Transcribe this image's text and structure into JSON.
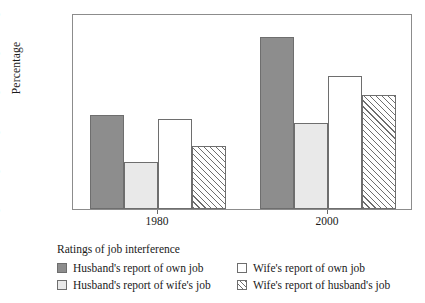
{
  "chart_data": {
    "type": "bar",
    "title": "",
    "xlabel": "",
    "ylabel": "Percentage",
    "categories": [
      "1980",
      "2000"
    ],
    "ylim": [
      0,
      50
    ],
    "yticks": [
      0,
      10,
      20,
      30,
      40,
      50
    ],
    "grid": false,
    "legend_position": "bottom",
    "legend_title": "Ratings of job interference",
    "series": [
      {
        "name": "Husband's report of own job",
        "style": "solid-dark",
        "color": "#8d8d8d",
        "values": [
          24,
          44
        ]
      },
      {
        "name": "Husband's report of wife's job",
        "style": "solid-light",
        "color": "#e9e9e9",
        "values": [
          12,
          22
        ]
      },
      {
        "name": "Wife's report of own job",
        "style": "solid-white",
        "color": "#ffffff",
        "values": [
          23,
          34
        ]
      },
      {
        "name": "Wife's report of husband's job",
        "style": "hatch",
        "color": "#ffffff",
        "values": [
          16,
          29
        ]
      }
    ]
  },
  "axis": {
    "y_label": "Percentage",
    "y_ticks": [
      "0",
      "10",
      "20",
      "30",
      "40",
      "50"
    ],
    "x_ticks": [
      "1980",
      "2000"
    ]
  },
  "legend": {
    "title": "Ratings of job interference",
    "items": [
      {
        "label": "Husband's report of own job",
        "swatch": "solid-dark"
      },
      {
        "label": "Wife's report of own job",
        "swatch": "solid-white"
      },
      {
        "label": "Husband's report of wife's job",
        "swatch": "solid-light"
      },
      {
        "label": "Wife's report of husband's job",
        "swatch": "hatch"
      }
    ]
  },
  "colors": {
    "dark_gray": "#8d8d8d",
    "light_gray": "#e9e9e9",
    "white": "#ffffff",
    "outline": "#6e6e6e",
    "frame": "#8c8c8c"
  }
}
